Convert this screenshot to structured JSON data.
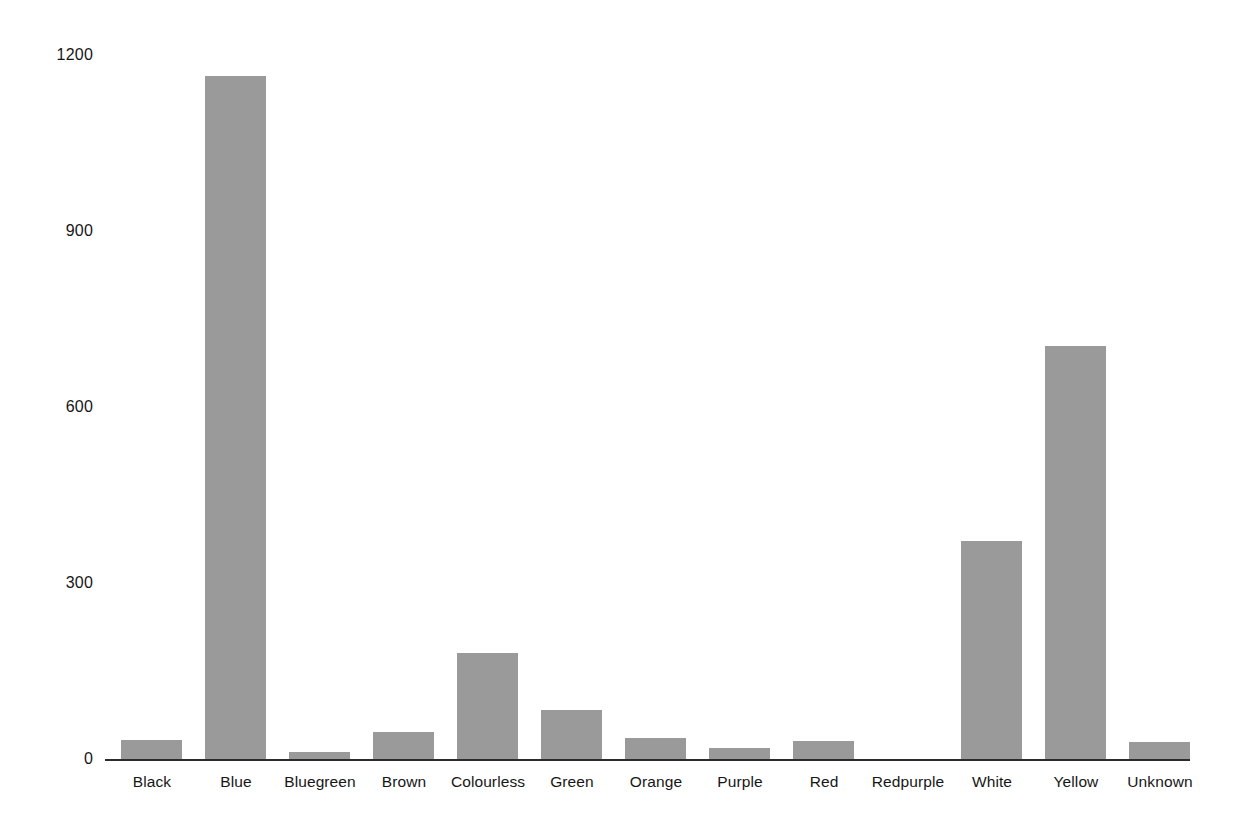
{
  "chart_data": {
    "type": "bar",
    "title": "",
    "subtitle": "",
    "xlabel": "",
    "ylabel": "",
    "categories": [
      "Black",
      "Blue",
      "Bluegreen",
      "Brown",
      "Colourless",
      "Green",
      "Orange",
      "Purple",
      "Red",
      "Redpurple",
      "White",
      "Yellow",
      "Unknown"
    ],
    "values": [
      32,
      1165,
      12,
      46,
      181,
      84,
      36,
      19,
      31,
      0,
      371,
      704,
      29
    ],
    "ylim": [
      0,
      1230
    ],
    "yticks": [
      0,
      300,
      600,
      900,
      1200
    ],
    "ytick_labels": [
      "0",
      "300",
      "600",
      "900",
      "1200"
    ],
    "grid": false,
    "legend": false,
    "bar_color": "#9a9a9a",
    "axis_color": "#2b2b2b",
    "background_color": "#ffffff"
  },
  "axis": {
    "y_ticks": [
      {
        "label": "1200",
        "value": 1200
      },
      {
        "label": "900",
        "value": 900
      },
      {
        "label": "600",
        "value": 600
      },
      {
        "label": "300",
        "value": 300
      },
      {
        "label": "0",
        "value": 0
      }
    ]
  },
  "bars": [
    {
      "label": "Black",
      "value": 32
    },
    {
      "label": "Blue",
      "value": 1165
    },
    {
      "label": "Bluegreen",
      "value": 12
    },
    {
      "label": "Brown",
      "value": 46
    },
    {
      "label": "Colourless",
      "value": 181
    },
    {
      "label": "Green",
      "value": 84
    },
    {
      "label": "Orange",
      "value": 36
    },
    {
      "label": "Purple",
      "value": 19
    },
    {
      "label": "Red",
      "value": 31
    },
    {
      "label": "Redpurple",
      "value": 0
    },
    {
      "label": "White",
      "value": 371
    },
    {
      "label": "Yellow",
      "value": 704
    },
    {
      "label": "Unknown",
      "value": 29
    }
  ]
}
